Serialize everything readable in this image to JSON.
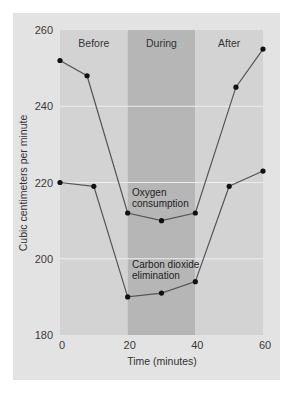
{
  "chart_data": {
    "type": "line",
    "title": "",
    "xlabel": "Time (minutes)",
    "ylabel": "Cubic centimeters per minute",
    "xlim": [
      0,
      60
    ],
    "ylim": [
      180,
      260
    ],
    "xticks": [
      0,
      20,
      40,
      60
    ],
    "yticks": [
      180,
      200,
      220,
      240,
      260
    ],
    "grid": "horizontal",
    "legend": "none (inline annotations)",
    "regions": [
      {
        "label": "Before",
        "x_start": 0,
        "x_end": 20,
        "color": "#d3d3d3"
      },
      {
        "label": "During",
        "x_start": 20,
        "x_end": 40,
        "color": "#b6b6b6"
      },
      {
        "label": "After",
        "x_start": 40,
        "x_end": 60,
        "color": "#d3d3d3"
      }
    ],
    "series": [
      {
        "name": "Oxygen consumption",
        "annotation": [
          "Oxygen",
          "consumption"
        ],
        "x": [
          0,
          8,
          20,
          30,
          40,
          52,
          60
        ],
        "values": [
          252,
          248,
          212,
          210,
          212,
          245,
          255
        ]
      },
      {
        "name": "Carbon dioxide elimination",
        "annotation": [
          "Carbon dioxide",
          "elimination"
        ],
        "x": [
          0,
          10,
          20,
          30,
          40,
          50,
          60
        ],
        "values": [
          220,
          219,
          190,
          191,
          194,
          219,
          223
        ]
      }
    ]
  },
  "colors": {
    "card_bg": "#e3e3e3",
    "region_outer": "#d3d3d3",
    "region_during": "#b6b6b6",
    "gridline": "#ececec",
    "line": "#555555",
    "marker": "#111111"
  }
}
